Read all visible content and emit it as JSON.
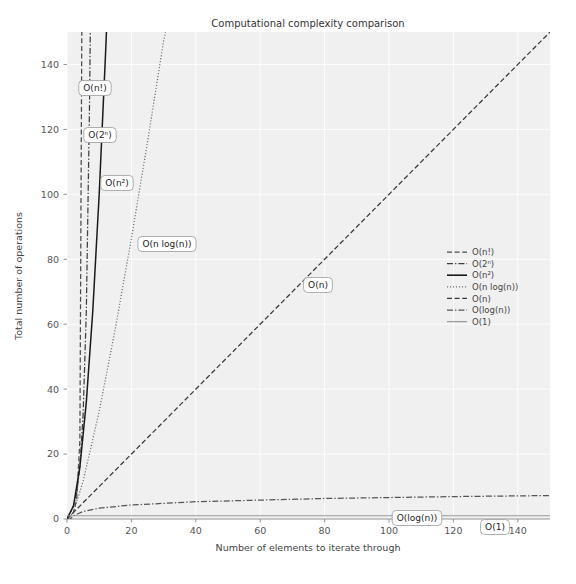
{
  "chart_data": {
    "type": "line",
    "title": "Computational complexity comparison",
    "xlabel": "Number of elements to iterate through",
    "ylabel": "Total number of operations",
    "xlim": [
      0,
      150
    ],
    "ylim": [
      0,
      150
    ],
    "xticks": [
      0,
      20,
      40,
      60,
      80,
      100,
      120,
      140
    ],
    "yticks": [
      0,
      20,
      40,
      60,
      80,
      100,
      120,
      140
    ],
    "grid": true,
    "legend_position": "center right",
    "background": "#f0f0f0",
    "series": [
      {
        "name": "O(n!)",
        "linestyle": "dashed",
        "color": "#4c4c4c",
        "inline_label": "O(n!)",
        "points": [
          [
            0,
            0
          ],
          [
            1,
            1
          ],
          [
            2,
            2
          ],
          [
            3,
            6
          ],
          [
            4,
            24
          ],
          [
            4.6,
            150
          ]
        ]
      },
      {
        "name": "O(2ⁿ)",
        "linestyle": "dashdot",
        "color": "#3f3f3f",
        "inline_label": "O(2ⁿ)",
        "points": [
          [
            0,
            0
          ],
          [
            1,
            2
          ],
          [
            2,
            4
          ],
          [
            3,
            8
          ],
          [
            4,
            16
          ],
          [
            5,
            32
          ],
          [
            6,
            64
          ],
          [
            7,
            128
          ],
          [
            7.23,
            150
          ]
        ]
      },
      {
        "name": "O(n²)",
        "linestyle": "solid",
        "color": "#1a1a1a",
        "inline_label": "O(n²)",
        "points": [
          [
            0,
            0
          ],
          [
            2,
            4
          ],
          [
            4,
            16
          ],
          [
            6,
            36
          ],
          [
            8,
            64
          ],
          [
            10,
            100
          ],
          [
            12,
            144
          ],
          [
            12.25,
            150
          ]
        ]
      },
      {
        "name": "O(n log(n))",
        "linestyle": "dotted",
        "color": "#6e6e6e",
        "inline_label": "O(n log(n))",
        "points": [
          [
            0,
            0
          ],
          [
            2,
            2
          ],
          [
            5,
            11.6
          ],
          [
            10,
            33.2
          ],
          [
            15,
            58.6
          ],
          [
            20,
            86.4
          ],
          [
            25,
            116.1
          ],
          [
            30,
            147.2
          ],
          [
            30.6,
            150
          ]
        ]
      },
      {
        "name": "O(n)",
        "linestyle": "dashed",
        "color": "#3a3a3a",
        "inline_label": "O(n)",
        "points": [
          [
            0,
            0
          ],
          [
            150,
            150
          ]
        ]
      },
      {
        "name": "O(log(n))",
        "linestyle": "dashdot",
        "color": "#555555",
        "inline_label": "O(log(n))",
        "points": [
          [
            0,
            0
          ],
          [
            1,
            0
          ],
          [
            2,
            1
          ],
          [
            5,
            2.32
          ],
          [
            10,
            3.32
          ],
          [
            20,
            4.32
          ],
          [
            40,
            5.32
          ],
          [
            80,
            6.32
          ],
          [
            120,
            6.9
          ],
          [
            150,
            7.23
          ]
        ]
      },
      {
        "name": "O(1)",
        "linestyle": "solid",
        "color": "#9a9a9a",
        "inline_label": "O(1)",
        "points": [
          [
            0,
            1
          ],
          [
            150,
            1
          ]
        ]
      }
    ],
    "annotations": [
      {
        "text": "O(n!)",
        "x_px": 95,
        "y_px": 88
      },
      {
        "text": "O(2ⁿ)",
        "x_px": 100,
        "y_px": 135
      },
      {
        "text": "O(n²)",
        "x_px": 117,
        "y_px": 183
      },
      {
        "text": "O(n log(n))",
        "x_px": 167,
        "y_px": 244
      },
      {
        "text": "O(n)",
        "x_px": 318,
        "y_px": 285
      },
      {
        "text": "O(log(n))",
        "x_px": 417,
        "y_px": 518
      },
      {
        "text": "O(1)",
        "x_px": 495,
        "y_px": 527
      }
    ]
  }
}
